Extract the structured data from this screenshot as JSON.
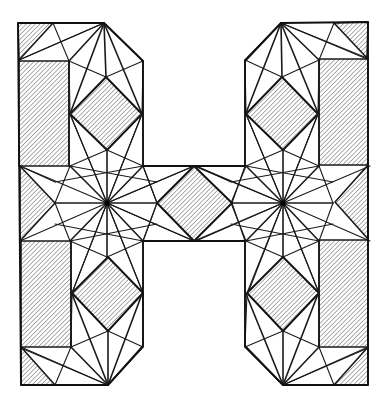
{
  "figure": {
    "letter": "H",
    "colors": {
      "line": "#1a1a1a",
      "hatch": "#6a6a6a",
      "background": "#ffffff"
    },
    "outline": [
      [
        18,
        23
      ],
      [
        104,
        23
      ],
      [
        143,
        61
      ],
      [
        143,
        166
      ],
      [
        245,
        166
      ],
      [
        245,
        61
      ],
      [
        281,
        23
      ],
      [
        368,
        22
      ],
      [
        368,
        385
      ],
      [
        283,
        385
      ],
      [
        245,
        346
      ],
      [
        245,
        241
      ],
      [
        143,
        241
      ],
      [
        143,
        346
      ],
      [
        108,
        385
      ],
      [
        21,
        385
      ]
    ],
    "star_centers": [
      [
        107,
        203
      ],
      [
        283,
        203
      ]
    ],
    "star_rays": 16,
    "diamonds": [
      {
        "name": "upper-left",
        "pts": [
          [
            106,
            77
          ],
          [
            142,
            114
          ],
          [
            107,
            150
          ],
          [
            70,
            114
          ]
        ]
      },
      {
        "name": "lower-left",
        "pts": [
          [
            108,
            257
          ],
          [
            143,
            293
          ],
          [
            108,
            331
          ],
          [
            72,
            293
          ]
        ]
      },
      {
        "name": "upper-right",
        "pts": [
          [
            282,
            77
          ],
          [
            318,
            114
          ],
          [
            283,
            150
          ],
          [
            246,
            114
          ]
        ]
      },
      {
        "name": "lower-right",
        "pts": [
          [
            283,
            257
          ],
          [
            319,
            293
          ],
          [
            283,
            331
          ],
          [
            247,
            293
          ]
        ]
      },
      {
        "name": "center",
        "pts": [
          [
            194,
            166
          ],
          [
            232,
            203
          ],
          [
            194,
            241
          ],
          [
            157,
            203
          ]
        ]
      }
    ],
    "hatched_rects": [
      {
        "name": "upper-left-bar",
        "x": 19,
        "y": 61,
        "w": 50,
        "h": 105
      },
      {
        "name": "lower-left-bar",
        "x": 21,
        "y": 241,
        "w": 50,
        "h": 106
      },
      {
        "name": "upper-right-bar",
        "x": 319,
        "y": 59,
        "w": 49,
        "h": 106
      },
      {
        "name": "lower-right-bar",
        "x": 319,
        "y": 240,
        "w": 49,
        "h": 107
      }
    ],
    "hatched_triangles": [
      {
        "name": "top-left-corner",
        "pts": [
          [
            18,
            23
          ],
          [
            53,
            23
          ],
          [
            19,
            60
          ]
        ]
      },
      {
        "name": "top-right-corner",
        "pts": [
          [
            334,
            23
          ],
          [
            368,
            22
          ],
          [
            367,
            58
          ]
        ]
      },
      {
        "name": "bottom-left-corner",
        "pts": [
          [
            21,
            347
          ],
          [
            21,
            385
          ],
          [
            55,
            385
          ]
        ]
      },
      {
        "name": "bottom-right-corner",
        "pts": [
          [
            368,
            347
          ],
          [
            368,
            385
          ],
          [
            334,
            385
          ]
        ]
      },
      {
        "name": "left-middle",
        "pts": [
          [
            20,
            166
          ],
          [
            20,
            241
          ],
          [
            55,
            203
          ]
        ]
      },
      {
        "name": "right-middle",
        "pts": [
          [
            368,
            165
          ],
          [
            368,
            239
          ],
          [
            335,
            202
          ]
        ]
      }
    ]
  }
}
